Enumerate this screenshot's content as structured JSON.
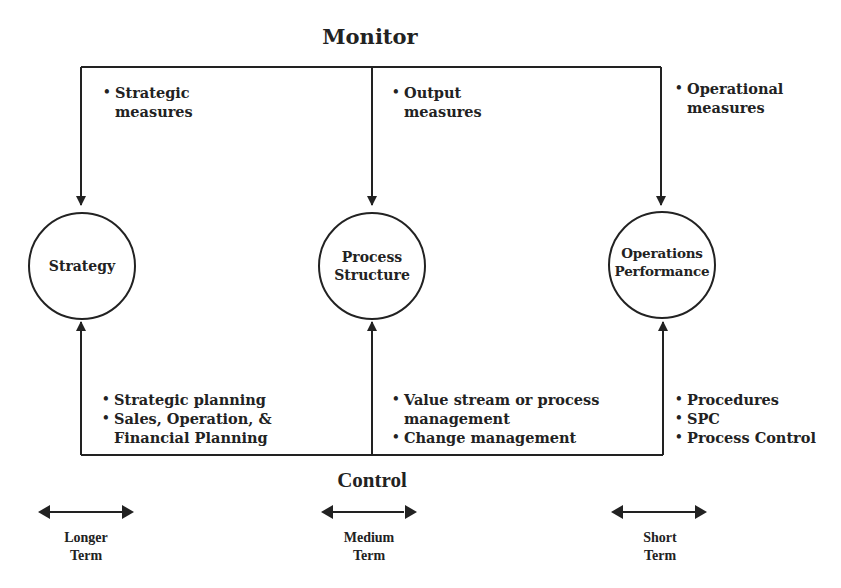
{
  "monitor": {
    "label": "Monitor"
  },
  "control": {
    "label": "Control"
  },
  "nodes": [
    {
      "id": "strategy",
      "label": "Strategy",
      "shape": "circle"
    },
    {
      "id": "process-structure",
      "label": "Process\nStructure",
      "shape": "circle"
    },
    {
      "id": "operations-performance",
      "label": "Operations\nPerformance",
      "shape": "circle"
    }
  ],
  "monitor_measures": {
    "strategy": [
      "Strategic\nmeasures"
    ],
    "process_structure": [
      "Output\nmeasures"
    ],
    "operations_performance": [
      "Operational\nmeasures"
    ]
  },
  "control_methods": {
    "strategy": [
      "Strategic planning",
      "Sales, Operation, &\nFinancial Planning"
    ],
    "process_structure": [
      "Value stream or process\nmanagement",
      "Change management"
    ],
    "operations_performance": [
      "Procedures",
      "SPC",
      "Process Control"
    ]
  },
  "time_horizons": [
    {
      "label": "Longer\nTerm"
    },
    {
      "label": "Medium\nTerm"
    },
    {
      "label": "Short\nTerm"
    }
  ],
  "colors": {
    "line": "#222222",
    "background": "#ffffff"
  }
}
